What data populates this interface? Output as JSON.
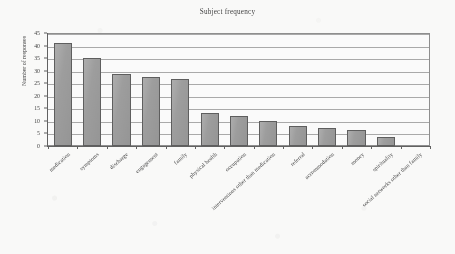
{
  "chart_data": {
    "type": "bar",
    "title": "Subject frequency",
    "xlabel": "",
    "ylabel": "Number of responses",
    "ylim": [
      0,
      45
    ],
    "ytick_step": 5,
    "yticks": [
      0,
      5,
      10,
      15,
      20,
      25,
      30,
      35,
      40,
      45
    ],
    "grid": true,
    "legend": false,
    "bar_color": "#9c9c9c",
    "bar_edge_color": "#5a5a5a",
    "categories": [
      "medication",
      "symptoms",
      "discharge",
      "engagement",
      "family",
      "physical health",
      "occupation",
      "interventions other than medication",
      "referral",
      "accommodation",
      "money",
      "spirituality",
      "social networks other than family"
    ],
    "values": [
      41,
      35,
      28.5,
      27.5,
      26.5,
      13,
      12,
      10,
      8,
      7,
      6.5,
      3.5,
      0
    ]
  },
  "axis": {
    "y_title": "Number of responses"
  }
}
